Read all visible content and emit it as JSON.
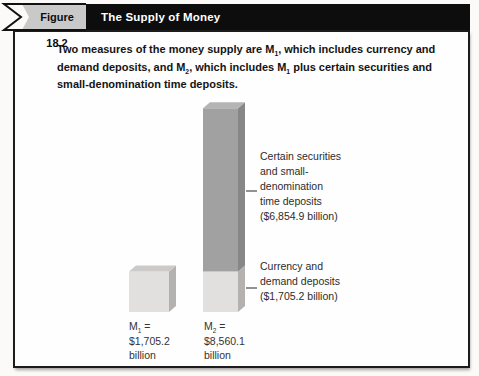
{
  "figure": {
    "label": "Figure 18.2",
    "title": "The Supply of Money"
  },
  "caption": {
    "lines": [
      "Two measures of the money supply are M[1], which includes currency and",
      "demand deposits, and M[2], which includes M[1] plus certain securities and",
      "small-denomination time deposits."
    ]
  },
  "chart_data": {
    "type": "bar",
    "stacked": true,
    "unit": "billions of dollars",
    "categories": [
      "M1",
      "M2"
    ],
    "series": [
      {
        "name": "Currency and demand deposits",
        "values": [
          1705.2,
          1705.2
        ]
      },
      {
        "name": "Certain securities and small-denomination time deposits",
        "values": [
          0,
          6854.9
        ]
      }
    ],
    "totals": [
      1705.2,
      8560.1
    ],
    "bar_labels": [
      {
        "lines": [
          "M[1] =",
          "$1,705.2",
          "billion"
        ]
      },
      {
        "lines": [
          "M[2] =",
          "$8,560.1",
          "billion"
        ]
      }
    ],
    "annotations": [
      {
        "target": "m2-upper-segment",
        "lines": [
          "Certain securities",
          "and small-",
          "denomination",
          "time deposits",
          "($6,854.9 billion)"
        ]
      },
      {
        "target": "m2-lower-segment",
        "lines": [
          "Currency and",
          "demand deposits",
          "($1,705.2 billion)"
        ]
      }
    ],
    "colors": {
      "light_face": "#e1e0de",
      "light_side": "#b3b2b0",
      "light_top": "#cbcac8",
      "dark_face": "#a1a1a1",
      "dark_side": "#878787",
      "dark_top": "#b4b4b4",
      "connector": "#4a4a4a"
    }
  },
  "theme": {
    "header_bg": "#0d0d0d",
    "header_text": "#ffffff",
    "figure_tab_bg": "#c9c9c9",
    "frame_border": "#1c1c1c"
  }
}
